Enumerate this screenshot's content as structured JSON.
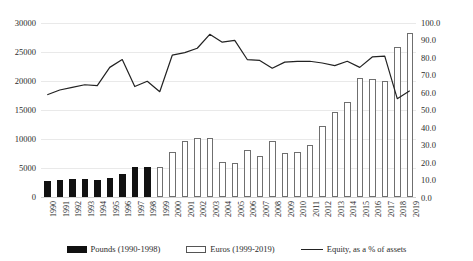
{
  "chart_data": {
    "type": "bar",
    "title": "",
    "subtitle": "",
    "xlabel": "",
    "ylabel": "",
    "y2label": "",
    "grid": true,
    "legend_position": "bottom",
    "categories": [
      "1990",
      "1991",
      "1992",
      "1993",
      "1994",
      "1995",
      "1996",
      "1997",
      "1998",
      "1999",
      "2000",
      "2001",
      "2002",
      "2003",
      "2004",
      "2005",
      "2006",
      "2007",
      "2008",
      "2009",
      "2010",
      "2011",
      "2012",
      "2013",
      "2014",
      "2015",
      "2016",
      "2017",
      "2018",
      "2019"
    ],
    "ylim": [
      0,
      30000
    ],
    "yticks": [
      "0",
      "5000",
      "10000",
      "15000",
      "20000",
      "25000",
      "30000"
    ],
    "y2lim": [
      0,
      100
    ],
    "y2ticks": [
      "0.0",
      "10.0",
      "20.0",
      "30.0",
      "40.0",
      "50.0",
      "60.0",
      "70.0",
      "80.0",
      "90.0",
      "100.0"
    ],
    "series": [
      {
        "name": "Pounds (1990-1998)",
        "type": "bar",
        "axis": "left",
        "color": "#111111",
        "fill": "solid",
        "values": [
          2750,
          2900,
          3100,
          3050,
          3000,
          3350,
          3950,
          5150,
          5200,
          null,
          null,
          null,
          null,
          null,
          null,
          null,
          null,
          null,
          null,
          null,
          null,
          null,
          null,
          null,
          null,
          null,
          null,
          null,
          null,
          null
        ]
      },
      {
        "name": "Euros (1999-2019)",
        "type": "bar",
        "axis": "left",
        "color": "#ffffff",
        "fill": "hollow",
        "values": [
          null,
          null,
          null,
          null,
          null,
          null,
          null,
          null,
          null,
          5200,
          7800,
          9700,
          10150,
          10100,
          6100,
          5800,
          8100,
          7000,
          9700,
          7650,
          7750,
          9000,
          12300,
          14600,
          16350,
          20500,
          20350,
          20000,
          25900,
          28350
        ]
      },
      {
        "name": "Equity, as a % of assets",
        "type": "line",
        "axis": "right",
        "color": "#222222",
        "values": [
          58.8,
          61.5,
          63.0,
          64.5,
          64.0,
          74.5,
          79.0,
          63.5,
          66.5,
          60.5,
          81.5,
          83.0,
          85.5,
          93.5,
          89.0,
          90.0,
          79.0,
          78.5,
          74.0,
          77.5,
          78.0,
          78.0,
          77.0,
          75.5,
          78.0,
          74.5,
          80.5,
          81.0,
          56.5,
          61.0
        ]
      }
    ]
  },
  "legend": {
    "items": [
      {
        "label": "Pounds (1990-1998)",
        "swatch": "filled-swatch-icon"
      },
      {
        "label": "Euros (1999-2019)",
        "swatch": "hollow-swatch-icon"
      },
      {
        "label": "Equity, as a % of assets",
        "swatch": "line-swatch-icon"
      }
    ]
  }
}
